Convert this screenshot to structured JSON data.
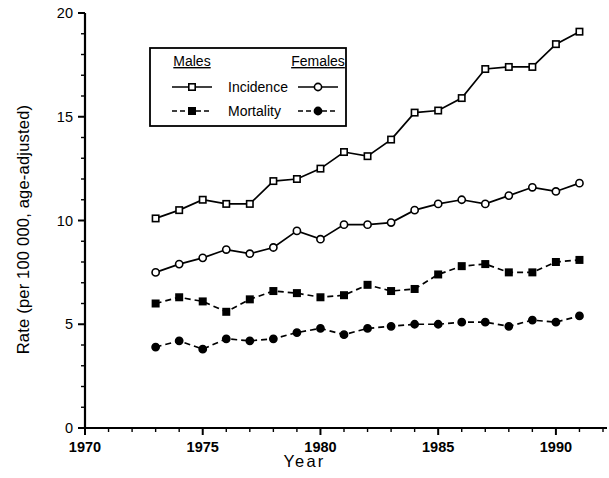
{
  "chart_data": {
    "type": "line",
    "title": "",
    "xlabel": "Year",
    "ylabel": "Rate (per 100 000, age-adjusted)",
    "xlim": [
      1970,
      1992
    ],
    "ylim": [
      0,
      20
    ],
    "xticks_major": [
      1970,
      1975,
      1980,
      1985,
      1990
    ],
    "xtick_labels": [
      "1970",
      "1975",
      "1980",
      "1985",
      "1990"
    ],
    "xtick_minor_step": 1,
    "yticks_major": [
      0,
      5,
      10,
      15,
      20
    ],
    "ytick_labels": [
      "0",
      "5",
      "10",
      "15",
      "20"
    ],
    "ytick_minor_step": 1,
    "grid": false,
    "legend_position": "upper-left-inside",
    "legend": {
      "col_headers": [
        "Males",
        "Females"
      ],
      "row_labels": [
        "Incidence",
        "Mortality"
      ],
      "entries": [
        {
          "label": "Incidence",
          "group": "Males",
          "marker": "open-square",
          "line": "solid"
        },
        {
          "label": "Incidence",
          "group": "Females",
          "marker": "open-circle",
          "line": "solid"
        },
        {
          "label": "Mortality",
          "group": "Males",
          "marker": "filled-square",
          "line": "dashed"
        },
        {
          "label": "Mortality",
          "group": "Females",
          "marker": "filled-circle",
          "line": "dashed"
        }
      ]
    },
    "x": [
      1973,
      1974,
      1975,
      1976,
      1977,
      1978,
      1979,
      1980,
      1981,
      1982,
      1983,
      1984,
      1985,
      1986,
      1987,
      1988,
      1989,
      1990,
      1991
    ],
    "series": [
      {
        "name": "Males Incidence",
        "marker": "open-square",
        "line": "solid",
        "values": [
          10.1,
          10.5,
          11.0,
          10.8,
          10.8,
          11.9,
          12.0,
          12.5,
          13.3,
          13.1,
          13.9,
          15.2,
          15.3,
          15.9,
          17.3,
          17.4,
          17.4,
          18.5,
          19.1
        ]
      },
      {
        "name": "Females Incidence",
        "marker": "open-circle",
        "line": "solid",
        "values": [
          7.5,
          7.9,
          8.2,
          8.6,
          8.4,
          8.7,
          9.5,
          9.1,
          9.8,
          9.8,
          9.9,
          10.5,
          10.8,
          11.0,
          10.8,
          11.2,
          11.6,
          11.4,
          11.8
        ]
      },
      {
        "name": "Males Mortality",
        "marker": "filled-square",
        "line": "dashed",
        "values": [
          6.0,
          6.3,
          6.1,
          5.6,
          6.2,
          6.6,
          6.5,
          6.3,
          6.4,
          6.9,
          6.6,
          6.7,
          7.4,
          7.8,
          7.9,
          7.5,
          7.5,
          8.0,
          8.1
        ]
      },
      {
        "name": "Females Mortality",
        "marker": "filled-circle",
        "line": "dashed",
        "values": [
          3.9,
          4.2,
          3.8,
          4.3,
          4.2,
          4.3,
          4.6,
          4.8,
          4.5,
          4.8,
          4.9,
          5.0,
          5.0,
          5.1,
          5.1,
          4.9,
          5.2,
          5.1,
          5.4
        ]
      }
    ]
  }
}
